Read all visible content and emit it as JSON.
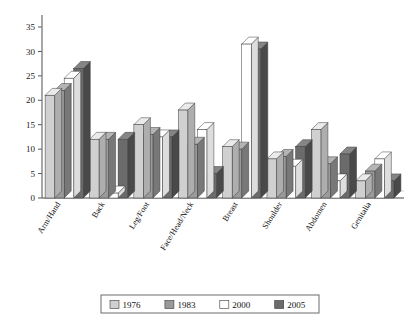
{
  "chart_data": {
    "type": "bar",
    "title": "",
    "xlabel": "",
    "ylabel": "",
    "ylim": [
      0,
      35
    ],
    "yticks": [
      0,
      5,
      10,
      15,
      20,
      25,
      30,
      35
    ],
    "grid": false,
    "legend_position": "bottom",
    "style": "3d-grouped-bars",
    "categories": [
      "Arm/Hand",
      "Back",
      "Leg/Foot",
      "Face/Head/Neck",
      "Breast",
      "Shoulder",
      "Abdomen",
      "Genitalia"
    ],
    "series": [
      {
        "name": "1976",
        "color": "#d0d0d0",
        "values": [
          21,
          12,
          15,
          18,
          10.5,
          8,
          14,
          3.5
        ]
      },
      {
        "name": "1983",
        "color": "#9a9a9a",
        "values": [
          22,
          12,
          13,
          11,
          10,
          8.5,
          7,
          5.5
        ]
      },
      {
        "name": "2000",
        "color": "#ffffff",
        "values": [
          24.5,
          1,
          12.5,
          14,
          31.5,
          6.5,
          3.5,
          8
        ]
      },
      {
        "name": "2005",
        "color": "#6b6b6b",
        "values": [
          26.5,
          12,
          12.5,
          5,
          30.5,
          10.5,
          9,
          3.5
        ]
      }
    ]
  },
  "legend": {
    "items": [
      {
        "label": "1976"
      },
      {
        "label": "1983"
      },
      {
        "label": "2000"
      },
      {
        "label": "2005"
      }
    ]
  }
}
